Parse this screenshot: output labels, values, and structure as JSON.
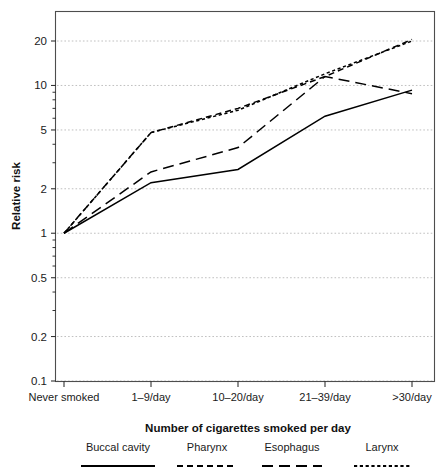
{
  "chart_data": {
    "type": "line",
    "title": "",
    "subtitle": "",
    "xlabel": "Number of cigarettes smoked per day",
    "ylabel": "Relative risk",
    "categories": [
      "Never smoked",
      "1–9/day",
      "10–20/day",
      "21–39/day",
      ">30/day"
    ],
    "x_tick_labels": [
      "Never smoked",
      "1–9/day",
      "10–20/day",
      "21–39/day",
      ">30/day"
    ],
    "y_tick_labels": [
      "20",
      "10",
      "5",
      "2",
      "1",
      "0.5",
      "0.2",
      "0.1"
    ],
    "y_tick_values": [
      20,
      10,
      5,
      2,
      1,
      0.5,
      0.2,
      0.1
    ],
    "yscale": "log",
    "ylim": [
      0.1,
      23
    ],
    "grid": true,
    "grid_axis": "y",
    "legend_position": "below-axis",
    "series": [
      {
        "name": "Buccal cavity",
        "linestyle": "solid",
        "color": "#000000",
        "values": [
          1,
          2.2,
          2.7,
          6.2,
          9.3
        ]
      },
      {
        "name": "Pharynx",
        "linestyle": "dashed-medium",
        "color": "#000000",
        "values": [
          1,
          4.8,
          7.0,
          11.5,
          20.5
        ]
      },
      {
        "name": "Esophagus",
        "linestyle": "dashed-long",
        "color": "#000000",
        "values": [
          1,
          2.6,
          3.8,
          11.5,
          8.8
        ]
      },
      {
        "name": "Larynx",
        "linestyle": "dotted-fine",
        "color": "#000000",
        "values": [
          1,
          4.8,
          6.8,
          12.0,
          20.0
        ]
      }
    ]
  },
  "axes": {
    "y_title": "Relative risk",
    "x_title": "Number of cigarettes smoked per day"
  },
  "yticks": [
    {
      "label": "20",
      "value": 20
    },
    {
      "label": "10",
      "value": 10
    },
    {
      "label": "5",
      "value": 5
    },
    {
      "label": "2",
      "value": 2
    },
    {
      "label": "1",
      "value": 1
    },
    {
      "label": "0.5",
      "value": 0.5
    },
    {
      "label": "0.2",
      "value": 0.2
    },
    {
      "label": "0.1",
      "value": 0.1
    }
  ],
  "xticks": [
    {
      "label": "Never smoked"
    },
    {
      "label": "1–9/day"
    },
    {
      "label": "10–20/day"
    },
    {
      "label": "21–39/day"
    },
    {
      "label": ">30/day"
    }
  ],
  "legend": {
    "items": [
      {
        "label": "Buccal cavity",
        "style": "solid"
      },
      {
        "label": "Pharynx",
        "style": "dashed-medium"
      },
      {
        "label": "Esophagus",
        "style": "dashed-long"
      },
      {
        "label": "Larynx",
        "style": "dotted-fine"
      }
    ]
  }
}
